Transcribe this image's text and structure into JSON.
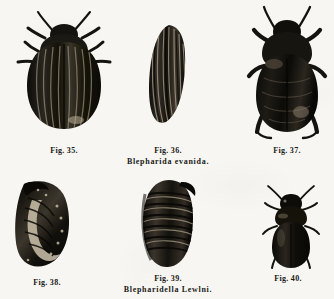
{
  "plate": {
    "kind": "engraved-natural-history-plate",
    "background_color": "#f7f6f2",
    "ink_color": "#14130f",
    "width": 334,
    "height": 299
  },
  "figures": [
    {
      "id": "fig-35",
      "label": "Fig. 35.",
      "subject": "adult-beetle-dorsal",
      "row": "top",
      "column": "left"
    },
    {
      "id": "fig-36",
      "label": "Fig. 36.",
      "subject": "beetle-elytron",
      "row": "top",
      "column": "center"
    },
    {
      "id": "fig-37",
      "label": "Fig. 37.",
      "subject": "adult-beetle-ventral",
      "row": "top",
      "column": "right"
    },
    {
      "id": "fig-38",
      "label": "Fig. 38.",
      "subject": "larva-curved",
      "row": "bottom",
      "column": "left"
    },
    {
      "id": "fig-39",
      "label": "Fig. 39.",
      "subject": "pupa-segmented",
      "row": "bottom",
      "column": "center"
    },
    {
      "id": "fig-40",
      "label": "Fig. 40.",
      "subject": "small-adult-beetle-dorsal",
      "row": "bottom",
      "column": "right"
    }
  ],
  "species_captions": [
    {
      "id": "species-top",
      "text": "Blepharida evanida.",
      "belongs_to": "Fig. 36."
    },
    {
      "id": "species-bottom",
      "text": "Blepharidella Lewlni.",
      "belongs_to": "Fig. 39."
    }
  ]
}
